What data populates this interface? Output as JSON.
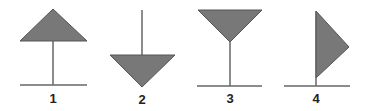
{
  "colors": {
    "fill": "#787878",
    "stroke": "#555555",
    "line": "#666666",
    "label": "#222222"
  },
  "figures": [
    {
      "label": "1",
      "description": "upward-pointing triangle on top of a vertical stem standing on a horizontal base line"
    },
    {
      "label": "2",
      "description": "downward-pointing triangle hanging from a vertical stem"
    },
    {
      "label": "3",
      "description": "inverted triangle on top of a vertical stem standing on a horizontal base line"
    },
    {
      "label": "4",
      "description": "right-pointing pennant flag on a vertical pole standing on a horizontal base line"
    }
  ]
}
